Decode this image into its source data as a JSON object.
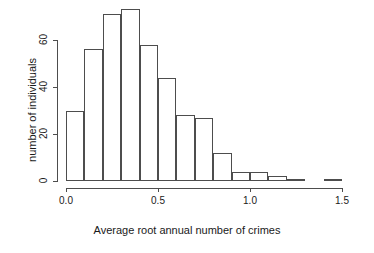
{
  "chart_data": {
    "type": "bar",
    "title": "",
    "subtitle": "",
    "xlabel": "Average root annual number of crimes",
    "ylabel": "number of individuals",
    "grid": false,
    "legend": null,
    "legend_position": "none",
    "binwidth": 0.1,
    "xlim": [
      0.0,
      1.5
    ],
    "ylim": [
      0,
      73
    ],
    "xticks": [
      "0.0",
      "0.5",
      "1.0",
      "1.5"
    ],
    "xtick_values": [
      0.0,
      0.5,
      1.0,
      1.5
    ],
    "yticks": [
      "0",
      "20",
      "40",
      "60"
    ],
    "ytick_values": [
      0,
      20,
      40,
      60
    ],
    "categories": [
      "0.0-0.1",
      "0.1-0.2",
      "0.2-0.3",
      "0.3-0.4",
      "0.4-0.5",
      "0.5-0.6",
      "0.6-0.7",
      "0.7-0.8",
      "0.8-0.9",
      "0.9-1.0",
      "1.0-1.1",
      "1.1-1.2",
      "1.2-1.3",
      "1.3-1.4",
      "1.4-1.5"
    ],
    "bin_starts": [
      0.0,
      0.1,
      0.2,
      0.3,
      0.4,
      0.5,
      0.6,
      0.7,
      0.8,
      0.9,
      1.0,
      1.1,
      1.2,
      1.3,
      1.4
    ],
    "values": [
      30,
      56,
      71,
      73,
      58,
      44,
      28,
      27,
      12,
      4,
      4,
      2,
      1,
      0,
      1
    ],
    "bar_color": "#ffffff",
    "bar_edge_color": "#4d4d4d",
    "axis_color": "#4d4d4d",
    "background": "#ffffff"
  }
}
